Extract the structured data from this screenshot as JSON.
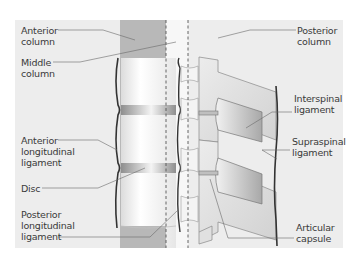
{
  "figure": {
    "colors": {
      "background": "#ffffff",
      "panel": "#ededed",
      "anterior_column_shade": "#b3b3b3",
      "vertebra_fill": "#f7f7f7",
      "disc_fill": "#9a9a9a",
      "posterior_element": "#e2e2e2",
      "ligament_line": "#3c3c3c",
      "leader_line": "#6a6a6a",
      "text": "#3a3a3a"
    }
  },
  "labels": {
    "anterior_column": "Anterior\ncolumn",
    "middle_column": "Middle\ncolumn",
    "posterior_column": "Posterior\ncolumn",
    "interspinal_ligament": "Interspinal\nligament",
    "supraspinal_ligament": "Supraspinal\nligament",
    "anterior_longitudinal_ligament": "Anterior\nlongitudinal\nligament",
    "disc": "Disc",
    "posterior_longitudinal_ligament": "Posterior\nlongitudinal\nligament",
    "articular_capsule": "Articular\ncapsule"
  }
}
